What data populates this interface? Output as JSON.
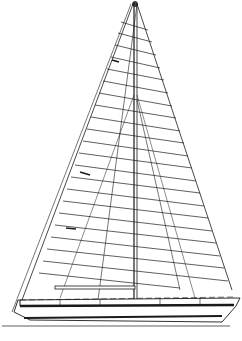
{
  "drawing": {
    "subject": "sailboat sail plan",
    "rig": "sloop",
    "background": "#ffffff",
    "line_color": "#1a1a1a",
    "mast": {
      "x": 135,
      "top_y": 2,
      "base_y": 300
    },
    "main": {
      "head": [
        133,
        4
      ],
      "clew": [
        22,
        300
      ],
      "tack": [
        133,
        300
      ],
      "battens": 22
    },
    "jib": {
      "head": [
        137,
        4
      ],
      "tack": [
        230,
        285
      ],
      "clew": [
        150,
        290
      ]
    },
    "hull": {
      "bow_x": 240,
      "stern_x": 12,
      "sheer_y": 298,
      "waterline_y": 326
    }
  }
}
